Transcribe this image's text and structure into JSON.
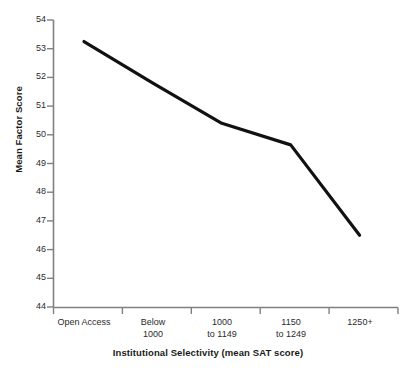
{
  "chart_data": {
    "type": "line",
    "title": "",
    "xlabel": "Institutional Selectivity (mean SAT score)",
    "ylabel": "Mean Factor Score",
    "categories": [
      "Open Access",
      "Below\n1000",
      "1000\nto 1149",
      "1150\nto 1249",
      "1250+"
    ],
    "values": [
      53.25,
      51.8,
      50.4,
      49.65,
      46.5
    ],
    "ylim": [
      44,
      54
    ],
    "yticks": [
      44,
      45,
      46,
      47,
      48,
      49,
      50,
      51,
      52,
      53,
      54
    ],
    "grid": false,
    "legend": false,
    "line_color": "#111111",
    "axis_color": "#808080"
  }
}
